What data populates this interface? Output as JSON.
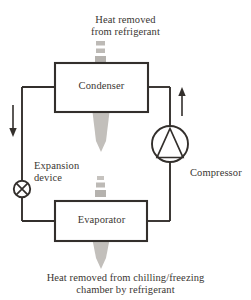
{
  "diagram": {
    "type": "schematic-flow-diagram",
    "colors": {
      "line": "#332f2c",
      "text": "#3a3632",
      "heat_arrow": "#b3b0ac",
      "background": "#ffffff"
    },
    "labels": {
      "heat_top": "Heat removed\nfrom refrigerant",
      "heat_bottom": "Heat removed from chilling/freezing\nchamber by refrigerant",
      "condenser": "Condenser",
      "evaporator": "Evaporator",
      "expansion_device": "Expansion\ndevice",
      "compressor": "Compressor"
    },
    "components": [
      {
        "name": "condenser",
        "shape": "rectangle",
        "label": "Condenser"
      },
      {
        "name": "evaporator",
        "shape": "rectangle",
        "label": "Evaporator"
      },
      {
        "name": "compressor",
        "shape": "circle-with-triangle",
        "label": "Compressor"
      },
      {
        "name": "expansion-device",
        "shape": "circle-with-cross",
        "label": "Expansion device"
      }
    ],
    "flow_arrows": [
      {
        "name": "left-flow-arrow",
        "direction": "down",
        "meaning": "refrigerant flows down to expansion device"
      },
      {
        "name": "right-flow-arrow",
        "direction": "up",
        "meaning": "refrigerant flows up to condenser"
      }
    ],
    "heat_arrows": [
      {
        "name": "condenser-heat-arrow",
        "direction": "up",
        "meaning": "heat removed from refrigerant"
      },
      {
        "name": "evaporator-heat-arrow",
        "direction": "up",
        "meaning": "heat removed from chamber by refrigerant"
      }
    ]
  }
}
